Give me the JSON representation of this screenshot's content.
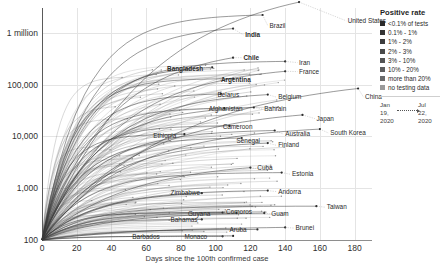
{
  "chart_data": {
    "type": "line",
    "title": "",
    "xlabel": "Days since the 100th confirmed case",
    "ylabel": "",
    "xlim": [
      0,
      190
    ],
    "ylim": [
      100,
      3000000
    ],
    "yscale": "log",
    "grid": true,
    "xticks": [
      "0",
      "20",
      "40",
      "60",
      "80",
      "100",
      "120",
      "140",
      "160",
      "180"
    ],
    "xtick_values": [
      0,
      20,
      40,
      60,
      80,
      100,
      120,
      140,
      160,
      180
    ],
    "yticks": [
      "100",
      "1,000",
      "10,000",
      "100,000",
      "1 million"
    ],
    "ytick_values": [
      100,
      1000,
      10000,
      100000,
      1000000
    ],
    "legend_position": "right",
    "series": [
      {
        "name": "United States",
        "end_x": 148,
        "end_y": 3900000,
        "label_x": 176,
        "label_y": 1700000,
        "bold": false
      },
      {
        "name": "Brazil",
        "end_x": 127,
        "end_y": 2200000,
        "label_x": 131,
        "label_y": 1350000,
        "bold": false
      },
      {
        "name": "India",
        "end_x": 110,
        "end_y": 1200000,
        "label_x": 117,
        "label_y": 900000,
        "bold": true
      },
      {
        "name": "Chile",
        "end_x": 110,
        "end_y": 330000,
        "label_x": 116,
        "label_y": 330000,
        "bold": true
      },
      {
        "name": "Iran",
        "end_x": 140,
        "end_y": 280000,
        "label_x": 148,
        "label_y": 265000,
        "bold": false
      },
      {
        "name": "Bangladesh",
        "end_x": 98,
        "end_y": 215000,
        "label_x": 72,
        "label_y": 200000,
        "bold": true
      },
      {
        "name": "France",
        "end_x": 140,
        "end_y": 180000,
        "label_x": 148,
        "label_y": 178000,
        "bold": false
      },
      {
        "name": "Argentina",
        "end_x": 110,
        "end_y": 130000,
        "label_x": 103,
        "label_y": 122000,
        "bold": true
      },
      {
        "name": "Belarus",
        "end_x": 103,
        "end_y": 66000,
        "label_x": 101,
        "label_y": 64000,
        "bold": false
      },
      {
        "name": "Belgium",
        "end_x": 130,
        "end_y": 64000,
        "label_x": 136,
        "label_y": 57000,
        "bold": false
      },
      {
        "name": "China",
        "end_x": 182,
        "end_y": 84000,
        "label_x": 186,
        "label_y": 57000,
        "bold": false
      },
      {
        "name": "Afghanistan",
        "end_x": 105,
        "end_y": 35000,
        "label_x": 96,
        "label_y": 33000,
        "bold": false
      },
      {
        "name": "Bahrain",
        "end_x": 122,
        "end_y": 36000,
        "label_x": 128,
        "label_y": 33500,
        "bold": false
      },
      {
        "name": "Japan",
        "end_x": 150,
        "end_y": 26000,
        "label_x": 158,
        "label_y": 22000,
        "bold": false
      },
      {
        "name": "Cameroon",
        "end_x": 108,
        "end_y": 16000,
        "label_x": 104,
        "label_y": 15000,
        "bold": false
      },
      {
        "name": "Australia",
        "end_x": 134,
        "end_y": 13000,
        "label_x": 140,
        "label_y": 11000,
        "bold": false
      },
      {
        "name": "South Korea",
        "end_x": 160,
        "end_y": 13800,
        "label_x": 166,
        "label_y": 11500,
        "bold": false
      },
      {
        "name": "Ethiopia",
        "end_x": 82,
        "end_y": 11000,
        "label_x": 64,
        "label_y": 10200,
        "bold": false
      },
      {
        "name": "Senegal",
        "end_x": 115,
        "end_y": 9300,
        "label_x": 112,
        "label_y": 8300,
        "bold": false
      },
      {
        "name": "Finland",
        "end_x": 130,
        "end_y": 7400,
        "label_x": 136,
        "label_y": 6700,
        "bold": false
      },
      {
        "name": "Cuba",
        "end_x": 120,
        "end_y": 2500,
        "label_x": 124,
        "label_y": 2400,
        "bold": false
      },
      {
        "name": "Estonia",
        "end_x": 138,
        "end_y": 2000,
        "label_x": 144,
        "label_y": 1850,
        "bold": false
      },
      {
        "name": "Andorra",
        "end_x": 130,
        "end_y": 900,
        "label_x": 136,
        "label_y": 860,
        "bold": false
      },
      {
        "name": "Zimbabwe",
        "end_x": 92,
        "end_y": 800,
        "label_x": 74,
        "label_y": 790,
        "bold": false
      },
      {
        "name": "Taiwan",
        "end_x": 158,
        "end_y": 450,
        "label_x": 164,
        "label_y": 430,
        "bold": false
      },
      {
        "name": "Guyana",
        "end_x": 112,
        "end_y": 330,
        "label_x": 84,
        "label_y": 320,
        "bold": false
      },
      {
        "name": "Guam",
        "end_x": 128,
        "end_y": 330,
        "label_x": 132,
        "label_y": 320,
        "bold": false
      },
      {
        "name": "Comoros",
        "end_x": 104,
        "end_y": 340,
        "label_x": 106,
        "label_y": 345,
        "bold": false
      },
      {
        "name": "Bahamas",
        "end_x": 92,
        "end_y": 250,
        "label_x": 74,
        "label_y": 245,
        "bold": false
      },
      {
        "name": "Aruba",
        "end_x": 124,
        "end_y": 160,
        "label_x": 108,
        "label_y": 155,
        "bold": false
      },
      {
        "name": "Brunei",
        "end_x": 140,
        "end_y": 175,
        "label_x": 146,
        "label_y": 170,
        "bold": false
      },
      {
        "name": "Barbados",
        "end_x": 104,
        "end_y": 118,
        "label_x": 52,
        "label_y": 115,
        "bold": false
      },
      {
        "name": "Monaco",
        "end_x": 110,
        "end_y": 120,
        "label_x": 82,
        "label_y": 116,
        "bold": false
      }
    ]
  },
  "legend": {
    "title": "Positive rate",
    "items": [
      {
        "label": "<0.1% of tests",
        "color": "#2b2b2b"
      },
      {
        "label": "0.1% - 1%",
        "color": "#343434"
      },
      {
        "label": "1% - 2%",
        "color": "#3d3d3d"
      },
      {
        "label": "2% - 3%",
        "color": "#4a4a4a"
      },
      {
        "label": "3% - 10%",
        "color": "#545454"
      },
      {
        "label": "10% - 20%",
        "color": "#5e5e5e"
      },
      {
        "label": "more than 20%",
        "color": "#6a6a6a"
      },
      {
        "label": "no testing data",
        "color": "#9a9a9a"
      }
    ]
  },
  "date_note": {
    "start": "Jan\n19,\n2020",
    "start_lines": [
      "Jan",
      "19,",
      "2020"
    ],
    "end_lines": [
      "Jul",
      "22,",
      "2020"
    ]
  }
}
